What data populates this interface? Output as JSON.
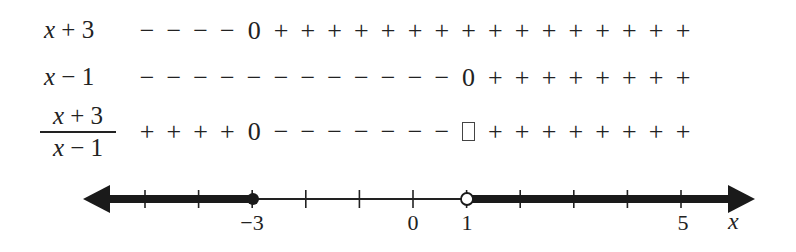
{
  "chart_data": {
    "type": "sign_chart",
    "title": "",
    "rows": [
      {
        "label": "x + 3",
        "signs": [
          "-",
          "-",
          "-",
          "-",
          "0",
          "+",
          "+",
          "+",
          "+",
          "+",
          "+",
          "+",
          "+",
          "+",
          "+",
          "+",
          "+",
          "+",
          "+",
          "+",
          "+"
        ]
      },
      {
        "label": "x − 1",
        "signs": [
          "-",
          "-",
          "-",
          "-",
          "-",
          "-",
          "-",
          "-",
          "-",
          "-",
          "-",
          "-",
          "0",
          "+",
          "+",
          "+",
          "+",
          "+",
          "+",
          "+",
          "+"
        ]
      },
      {
        "label": "(x + 3)/(x − 1)",
        "signs": [
          "+",
          "+",
          "+",
          "+",
          "0",
          "-",
          "-",
          "-",
          "-",
          "-",
          "-",
          "-",
          "undefined",
          "+",
          "+",
          "+",
          "+",
          "+",
          "+",
          "+",
          "+"
        ]
      }
    ],
    "number_line": {
      "xlabel": "x",
      "range": [
        -5,
        5
      ],
      "tick_labels": [
        {
          "value": -3,
          "label": "−3"
        },
        {
          "value": 0,
          "label": "0"
        },
        {
          "value": 1,
          "label": "1"
        },
        {
          "value": 5,
          "label": "5"
        }
      ],
      "ticks": [
        -5,
        -4,
        -3,
        -2,
        -1,
        0,
        1,
        2,
        3,
        4,
        5
      ],
      "solution_set": "(-∞, -3] ∪ (1, ∞)",
      "closed_points": [
        -3
      ],
      "open_points": [
        1
      ],
      "shaded_intervals": [
        [
          "-inf",
          -3
        ],
        [
          1,
          "inf"
        ]
      ]
    }
  },
  "rows": [
    {
      "var": "x",
      "rest": " + 3"
    },
    {
      "var": "x",
      "rest": " − 1"
    }
  ],
  "fraction": {
    "num_var": "x",
    "num_rest": " + 3",
    "den_var": "x",
    "den_rest": " − 1"
  },
  "symbols": {
    "plus": "+",
    "minus": "−",
    "zero": "0"
  },
  "axis": {
    "label_m3": "−3",
    "label_0": "0",
    "label_1": "1",
    "label_5": "5",
    "xlabel": "x"
  }
}
